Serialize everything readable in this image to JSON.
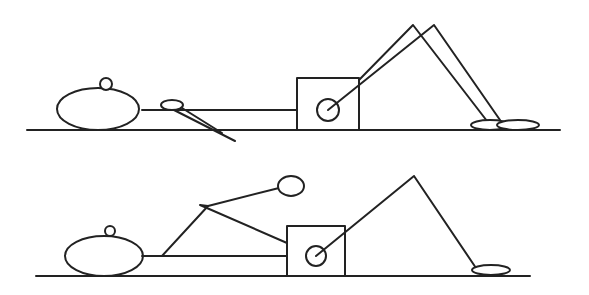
{
  "diagram": {
    "colors": {
      "stroke": "#222222",
      "background": "#ffffff"
    },
    "figures": [
      {
        "name": "top-figure",
        "pose": "both legs bent with knees raised, arm extended downward along body"
      },
      {
        "name": "bottom-figure",
        "pose": "one leg bent with knee raised, arm raised with bent elbow"
      }
    ]
  }
}
